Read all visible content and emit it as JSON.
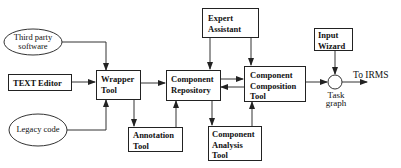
{
  "diagram": {
    "nodes": {
      "third_party": {
        "label_line1": "Third party",
        "label_line2": "software",
        "shape": "ellipse"
      },
      "text_editor": {
        "label": "TEXT Editor",
        "shape": "box"
      },
      "legacy_code": {
        "label": "Legacy code",
        "shape": "ellipse"
      },
      "wrapper_tool": {
        "label_line1": "Wrapper",
        "label_line2": "Tool",
        "shape": "box"
      },
      "annotation_tool": {
        "label_line1": "Annotation",
        "label_line2": "Tool",
        "shape": "box"
      },
      "component_repository": {
        "label_line1": "Component",
        "label_line2": "Repository",
        "shape": "box"
      },
      "expert_assistant": {
        "label_line1": "Expert",
        "label_line2": "Assistant",
        "shape": "box"
      },
      "component_composition_tool": {
        "label_line1": "Component",
        "label_line2": "Composition",
        "label_line3": "Tool",
        "shape": "box"
      },
      "component_analysis_tool": {
        "label_line1": "Component",
        "label_line2": "Analysis",
        "label_line3": "Tool",
        "shape": "box"
      },
      "input_wizard": {
        "label_line1": "Input",
        "label_line2": "Wizard",
        "shape": "box"
      },
      "task_graph": {
        "label_line1": "Task",
        "label_line2": "graph",
        "shape": "circle"
      }
    },
    "output_label": "To IRMS",
    "edges": [
      {
        "from": "Third party software",
        "to": "Wrapper Tool"
      },
      {
        "from": "TEXT Editor",
        "to": "Wrapper Tool"
      },
      {
        "from": "Legacy code",
        "to": "Wrapper Tool"
      },
      {
        "from": "Wrapper Tool",
        "to": "Annotation Tool"
      },
      {
        "from": "Wrapper Tool",
        "to": "Component Repository"
      },
      {
        "from": "Annotation Tool",
        "to": "Component Repository"
      },
      {
        "from": "Expert Assistant",
        "to": "Component Repository"
      },
      {
        "from": "Expert Assistant",
        "to": "Component Composition Tool"
      },
      {
        "from": "Component Repository",
        "to": "Component Composition Tool"
      },
      {
        "from": "Component Composition Tool",
        "to": "Component Repository"
      },
      {
        "from": "Component Repository",
        "to": "Component Analysis Tool"
      },
      {
        "from": "Component Analysis Tool",
        "to": "Component Composition Tool"
      },
      {
        "from": "Component Composition Tool",
        "to": "Task graph"
      },
      {
        "from": "Input Wizard",
        "to": "Task graph"
      },
      {
        "from": "Task graph",
        "to": "To IRMS"
      }
    ]
  }
}
